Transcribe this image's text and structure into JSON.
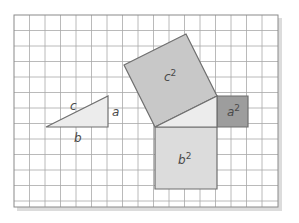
{
  "figure": {
    "grid": {
      "x0": 14,
      "y0": 15,
      "cell": 15.5,
      "cols": 17,
      "rows": 12,
      "line_color": "#9a9a9a",
      "border_color": "#8a8a8a",
      "bg": "#ffffff"
    },
    "colors": {
      "c2_fill": "#c8c8c8",
      "a2_fill": "#9d9d9d",
      "b2_fill": "#dcdcdc",
      "triangle_fill": "#ececec",
      "stroke": "#6f6f6f",
      "shadow": "#d6d6d6"
    },
    "small_triangle": {
      "points": "46,127 108,127 108,96",
      "labels": {
        "c": "c",
        "a": "a",
        "b": "b"
      }
    },
    "big_triangle": {
      "points": "155,127 217,127 217,96"
    },
    "squares": {
      "c2": {
        "points": "155,127 217,96 186,34 124,65",
        "label": "c",
        "exp": "2"
      },
      "a2": {
        "points": "217,96 248,96 248,127 217,127",
        "label": "a",
        "exp": "2"
      },
      "b2": {
        "points": "155,127 217,127 217,189 155,189",
        "label": "b",
        "exp": "2"
      }
    }
  }
}
